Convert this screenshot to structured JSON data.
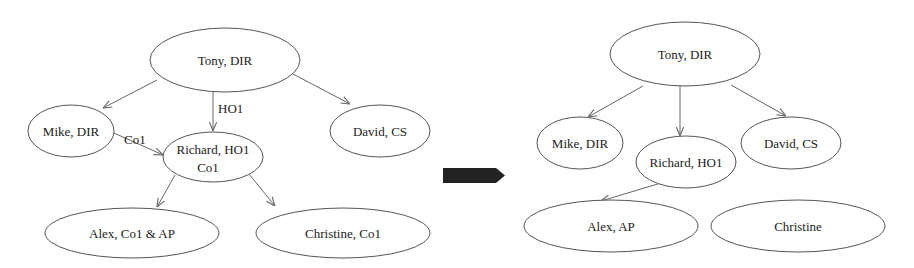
{
  "before": {
    "nodes": [
      {
        "id": "tony",
        "label": "Tony, DIR",
        "cx": 225,
        "cy": 60,
        "rx": 75,
        "ry": 32
      },
      {
        "id": "mike",
        "label": "Mike, DIR",
        "cx": 71,
        "cy": 131,
        "rx": 43,
        "ry": 26
      },
      {
        "id": "richard",
        "label": "Richard, HO1",
        "label2": "Co1",
        "cx": 213,
        "cy": 157,
        "rx": 50,
        "ry": 25
      },
      {
        "id": "david",
        "label": "David, CS",
        "cx": 380,
        "cy": 131,
        "rx": 50,
        "ry": 26
      },
      {
        "id": "alex",
        "label": "Alex, Co1 & AP",
        "cx": 132,
        "cy": 233,
        "rx": 87,
        "ry": 25
      },
      {
        "id": "christine",
        "label": "Christine, Co1",
        "cx": 343,
        "cy": 233,
        "rx": 87,
        "ry": 25
      }
    ],
    "edges": [
      {
        "from": "tony",
        "to": "mike",
        "label": ""
      },
      {
        "from": "tony",
        "to": "richard",
        "label": "HO1"
      },
      {
        "from": "tony",
        "to": "david",
        "label": ""
      },
      {
        "from": "mike",
        "to": "richard",
        "label": "Co1"
      },
      {
        "from": "richard",
        "to": "alex",
        "label": ""
      },
      {
        "from": "richard",
        "to": "christine",
        "label": ""
      }
    ]
  },
  "transition_arrow": {
    "color": "#222222"
  },
  "after": {
    "nodes": [
      {
        "id": "tony",
        "label": "Tony, DIR",
        "cx": 685,
        "cy": 54,
        "rx": 75,
        "ry": 32
      },
      {
        "id": "mike",
        "label": "Mike, DIR",
        "cx": 580,
        "cy": 143,
        "rx": 43,
        "ry": 26
      },
      {
        "id": "richard",
        "label": "Richard, HO1",
        "cx": 686,
        "cy": 162,
        "rx": 50,
        "ry": 26
      },
      {
        "id": "david",
        "label": "David, CS",
        "cx": 791,
        "cy": 143,
        "rx": 50,
        "ry": 26
      },
      {
        "id": "alex",
        "label": "Alex, AP",
        "cx": 611,
        "cy": 226,
        "rx": 87,
        "ry": 26
      },
      {
        "id": "christine",
        "label": "Christine",
        "cx": 798,
        "cy": 226,
        "rx": 87,
        "ry": 26
      }
    ],
    "edges": [
      {
        "from": "tony",
        "to": "mike"
      },
      {
        "from": "tony",
        "to": "richard"
      },
      {
        "from": "tony",
        "to": "david"
      },
      {
        "from": "richard",
        "to": "alex"
      }
    ]
  }
}
